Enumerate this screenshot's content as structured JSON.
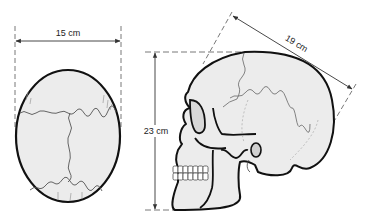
{
  "diagram": {
    "top_view": {
      "width_label": "15 cm"
    },
    "side_view": {
      "height_label": "23 cm",
      "length_label": "19 cm"
    },
    "colors": {
      "bone_fill": "#ececec",
      "outline": "#111111",
      "suture": "#555555",
      "dimension_line": "#333333"
    }
  }
}
